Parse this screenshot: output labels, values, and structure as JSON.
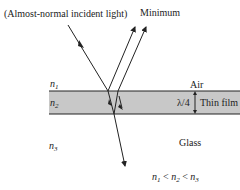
{
  "diagram": {
    "title_incident": "(Almost-normal incident light)",
    "title_reflected": "Minimum",
    "media": {
      "n1_label": "n",
      "n1_sub": "1",
      "n2_label": "n",
      "n2_sub": "2",
      "n3_label": "n",
      "n3_sub": "3",
      "air": "Air",
      "film": "Thin film",
      "glass": "Glass",
      "thickness": "λ/4"
    },
    "relation": {
      "a": "n",
      "a_sub": "1",
      "op1": "<",
      "b": "n",
      "b_sub": "2",
      "op2": "<",
      "c": "n",
      "c_sub": "3"
    },
    "colors": {
      "film": "#c8c8c8",
      "line": "#222222"
    }
  }
}
